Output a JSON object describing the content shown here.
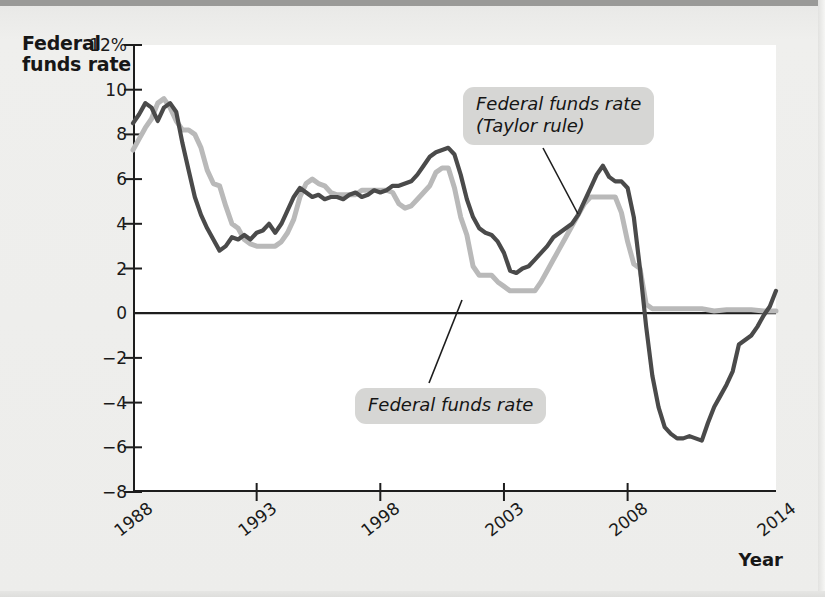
{
  "page": {
    "background_color": "#ededeb",
    "plot_background_color": "#ffffff"
  },
  "axis_titles": {
    "y_line1": "Federal",
    "y_line2": "funds rate",
    "x": "Year"
  },
  "callouts": {
    "taylor_line1": "Federal funds rate",
    "taylor_line2": "(Taylor rule)",
    "actual": "Federal funds rate"
  },
  "chart_data": {
    "type": "line",
    "title": "Federal funds rate",
    "xlabel": "Year",
    "ylabel": "Federal funds rate",
    "xlim": [
      1988,
      2014
    ],
    "ylim": [
      -8,
      12
    ],
    "yticks": [
      12,
      10,
      8,
      6,
      4,
      2,
      0,
      -2,
      -4,
      -6,
      -8
    ],
    "ytick_labels": [
      "12%",
      "10",
      "8",
      "6",
      "4",
      "2",
      "0",
      "−2",
      "−4",
      "−6",
      "−8"
    ],
    "xticks": [
      1988,
      1993,
      1998,
      2003,
      2008,
      2014
    ],
    "xtick_labels": [
      "1988",
      "1993",
      "1998",
      "2003",
      "2008",
      "2014"
    ],
    "grid": false,
    "zero_line": true,
    "legend": "annotations",
    "series": [
      {
        "name": "Federal funds rate (Taylor rule)",
        "color": "#4a4a4a",
        "width": 4.2,
        "x": [
          1988.0,
          1988.25,
          1988.5,
          1988.75,
          1989.0,
          1989.25,
          1989.5,
          1989.75,
          1990.0,
          1990.25,
          1990.5,
          1990.75,
          1991.0,
          1991.25,
          1991.5,
          1991.75,
          1992.0,
          1992.25,
          1992.5,
          1992.75,
          1993.0,
          1993.25,
          1993.5,
          1993.75,
          1994.0,
          1994.25,
          1994.5,
          1994.75,
          1995.0,
          1995.25,
          1995.5,
          1995.75,
          1996.0,
          1996.25,
          1996.5,
          1996.75,
          1997.0,
          1997.25,
          1997.5,
          1997.75,
          1998.0,
          1998.25,
          1998.5,
          1998.75,
          1999.0,
          1999.25,
          1999.5,
          1999.75,
          2000.0,
          2000.25,
          2000.5,
          2000.75,
          2001.0,
          2001.25,
          2001.5,
          2001.75,
          2002.0,
          2002.25,
          2002.5,
          2002.75,
          2003.0,
          2003.25,
          2003.5,
          2003.75,
          2004.0,
          2004.25,
          2004.5,
          2004.75,
          2005.0,
          2005.25,
          2005.5,
          2005.75,
          2006.0,
          2006.25,
          2006.5,
          2006.75,
          2007.0,
          2007.25,
          2007.5,
          2007.75,
          2008.0,
          2008.25,
          2008.5,
          2008.75,
          2009.0,
          2009.25,
          2009.5,
          2009.75,
          2010.0,
          2010.25,
          2010.5,
          2010.75,
          2011.0,
          2011.25,
          2011.5,
          2011.75,
          2012.0,
          2012.25,
          2012.5,
          2012.75,
          2013.0,
          2013.25,
          2013.5,
          2013.75,
          2014.0
        ],
        "y": [
          8.5,
          8.9,
          9.4,
          9.2,
          8.6,
          9.2,
          9.4,
          9.0,
          7.6,
          6.4,
          5.2,
          4.4,
          3.8,
          3.3,
          2.8,
          3.0,
          3.4,
          3.3,
          3.5,
          3.3,
          3.6,
          3.7,
          4.0,
          3.6,
          4.0,
          4.6,
          5.2,
          5.6,
          5.4,
          5.2,
          5.3,
          5.1,
          5.2,
          5.2,
          5.1,
          5.3,
          5.4,
          5.2,
          5.3,
          5.5,
          5.4,
          5.5,
          5.7,
          5.7,
          5.8,
          5.9,
          6.2,
          6.6,
          7.0,
          7.2,
          7.3,
          7.4,
          7.1,
          6.2,
          5.1,
          4.3,
          3.8,
          3.6,
          3.5,
          3.2,
          2.7,
          1.9,
          1.8,
          2.0,
          2.1,
          2.4,
          2.7,
          3.0,
          3.4,
          3.6,
          3.8,
          4.0,
          4.4,
          5.0,
          5.6,
          6.2,
          6.6,
          6.1,
          5.9,
          5.9,
          5.6,
          4.3,
          2.0,
          -0.6,
          -2.8,
          -4.2,
          -5.1,
          -5.4,
          -5.6,
          -5.6,
          -5.5,
          -5.6,
          -5.7,
          -4.9,
          -4.2,
          -3.7,
          -3.2,
          -2.6,
          -1.4,
          -1.2,
          -1.0,
          -0.6,
          -0.1,
          0.3,
          1.0
        ]
      },
      {
        "name": "Federal funds rate",
        "color": "#b9b9b9",
        "width": 5.0,
        "x": [
          1988.0,
          1988.25,
          1988.5,
          1988.75,
          1989.0,
          1989.25,
          1989.5,
          1989.75,
          1990.0,
          1990.25,
          1990.5,
          1990.75,
          1991.0,
          1991.25,
          1991.5,
          1991.75,
          1992.0,
          1992.25,
          1992.5,
          1992.75,
          1993.0,
          1993.25,
          1993.5,
          1993.75,
          1994.0,
          1994.25,
          1994.5,
          1994.75,
          1995.0,
          1995.25,
          1995.5,
          1995.75,
          1996.0,
          1996.25,
          1996.5,
          1996.75,
          1997.0,
          1997.25,
          1997.5,
          1997.75,
          1998.0,
          1998.25,
          1998.5,
          1998.75,
          1999.0,
          1999.25,
          1999.5,
          1999.75,
          2000.0,
          2000.25,
          2000.5,
          2000.75,
          2001.0,
          2001.25,
          2001.5,
          2001.75,
          2002.0,
          2002.25,
          2002.5,
          2002.75,
          2003.0,
          2003.25,
          2003.5,
          2003.75,
          2004.0,
          2004.25,
          2004.5,
          2004.75,
          2005.0,
          2005.25,
          2005.5,
          2005.75,
          2006.0,
          2006.25,
          2006.5,
          2006.75,
          2007.0,
          2007.25,
          2007.5,
          2007.75,
          2008.0,
          2008.25,
          2008.5,
          2008.75,
          2009.0,
          2009.5,
          2010.0,
          2010.5,
          2011.0,
          2011.5,
          2012.0,
          2012.5,
          2013.0,
          2013.5,
          2014.0
        ],
        "y": [
          7.3,
          7.8,
          8.3,
          8.7,
          9.4,
          9.6,
          9.2,
          8.6,
          8.2,
          8.2,
          8.0,
          7.4,
          6.4,
          5.8,
          5.7,
          4.8,
          4.0,
          3.8,
          3.3,
          3.1,
          3.0,
          3.0,
          3.0,
          3.0,
          3.2,
          3.6,
          4.2,
          5.2,
          5.8,
          6.0,
          5.8,
          5.7,
          5.4,
          5.3,
          5.3,
          5.3,
          5.3,
          5.5,
          5.5,
          5.5,
          5.5,
          5.5,
          5.4,
          4.9,
          4.7,
          4.8,
          5.1,
          5.4,
          5.7,
          6.3,
          6.5,
          6.5,
          5.6,
          4.3,
          3.5,
          2.1,
          1.7,
          1.7,
          1.7,
          1.4,
          1.2,
          1.0,
          1.0,
          1.0,
          1.0,
          1.0,
          1.4,
          1.9,
          2.4,
          2.9,
          3.4,
          3.9,
          4.4,
          4.9,
          5.2,
          5.2,
          5.2,
          5.2,
          5.2,
          4.5,
          3.2,
          2.2,
          2.0,
          0.4,
          0.2,
          0.2,
          0.2,
          0.2,
          0.2,
          0.1,
          0.15,
          0.15,
          0.15,
          0.1,
          0.1
        ]
      }
    ]
  }
}
